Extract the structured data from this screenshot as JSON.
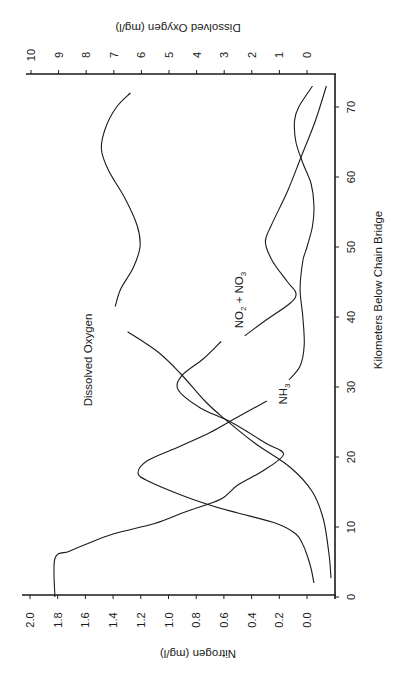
{
  "chart_data": {
    "type": "line",
    "orientation": "rotated-90-ccw",
    "title": "",
    "xlabel": "Kilometers Below Chain Bridge",
    "ylabel": "Nitrogen  (mg/l)",
    "y2label": "Dissolved Oxygen  (mg/l)",
    "xlim": [
      0,
      74
    ],
    "ylim": [
      -0.1,
      2.0
    ],
    "y2lim": [
      -0.5,
      10
    ],
    "x_ticks": [
      0,
      10,
      20,
      30,
      40,
      50,
      60,
      70
    ],
    "y_ticks": [
      "0.0",
      "0.2",
      "0.4",
      "0.6",
      "0.8",
      "1.0",
      "1.2",
      "1.4",
      "1.6",
      "1.8",
      "2.0"
    ],
    "y2_ticks": [
      "0",
      "1",
      "2",
      "3",
      "4",
      "5",
      "6",
      "7",
      "8",
      "9",
      "10"
    ],
    "grid": false,
    "legend": "inline curve labels",
    "series": [
      {
        "name": "Dissolved Oxygen",
        "label": "Dissolved Oxygen",
        "axis": "y2",
        "segments": [
          [
            [
              72.0,
              6.4
            ],
            [
              70.0,
              6.9
            ],
            [
              67.0,
              7.3
            ],
            [
              64.0,
              7.45
            ],
            [
              61.0,
              7.2
            ],
            [
              57.0,
              6.6
            ],
            [
              53.0,
              6.15
            ],
            [
              50.0,
              6.05
            ],
            [
              47.0,
              6.3
            ],
            [
              44.0,
              6.75
            ],
            [
              41.5,
              6.95
            ]
          ],
          [
            [
              37.9,
              6.5
            ],
            [
              35.0,
              5.4
            ],
            [
              32.0,
              4.6
            ],
            [
              28.0,
              3.7
            ],
            [
              25.5,
              3.0
            ],
            [
              22.0,
              1.9
            ],
            [
              18.5,
              0.6
            ],
            [
              15.0,
              -0.2
            ],
            [
              11.0,
              -0.6
            ],
            [
              6.0,
              -0.8
            ],
            [
              2.7,
              -0.87
            ]
          ]
        ]
      },
      {
        "name": "NO2 + NO3",
        "label": "NO2 + NO3",
        "axis": "y",
        "segments": [
          [
            [
              0.0,
              1.82
            ],
            [
              5.5,
              1.82
            ],
            [
              6.5,
              1.72
            ],
            [
              7.5,
              1.6
            ],
            [
              9.0,
              1.4
            ],
            [
              10.5,
              1.1
            ],
            [
              12.0,
              0.9
            ],
            [
              12.5,
              0.83
            ],
            [
              14.0,
              0.62
            ],
            [
              16.0,
              0.5
            ],
            [
              18.0,
              0.32
            ],
            [
              20.4,
              0.17
            ],
            [
              22.0,
              0.3
            ],
            [
              25.0,
              0.55
            ],
            [
              27.0,
              0.77
            ],
            [
              29.6,
              0.93
            ],
            [
              31.7,
              0.9
            ],
            [
              34.0,
              0.75
            ],
            [
              36.5,
              0.62
            ]
          ],
          [
            [
              37.3,
              0.45
            ],
            [
              39.5,
              0.3
            ],
            [
              42.0,
              0.12
            ],
            [
              43.4,
              0.08
            ],
            [
              45.0,
              0.14
            ],
            [
              48.0,
              0.25
            ],
            [
              50.7,
              0.3
            ],
            [
              53.0,
              0.26
            ],
            [
              58.0,
              0.14
            ],
            [
              63.0,
              0.04
            ],
            [
              68.0,
              -0.06
            ],
            [
              73.0,
              -0.14
            ]
          ]
        ]
      },
      {
        "name": "NH3",
        "label": "NH3",
        "axis": "y",
        "segments": [
          [
            [
              2.0,
              -0.05
            ],
            [
              4.0,
              -0.03
            ],
            [
              6.0,
              0.0
            ],
            [
              7.5,
              0.03
            ],
            [
              9.0,
              0.08
            ],
            [
              10.5,
              0.22
            ],
            [
              12.0,
              0.5
            ],
            [
              13.0,
              0.68
            ],
            [
              14.5,
              0.9
            ],
            [
              16.5,
              1.14
            ],
            [
              17.7,
              1.22
            ],
            [
              19.5,
              1.15
            ],
            [
              21.5,
              0.92
            ],
            [
              23.5,
              0.7
            ],
            [
              25.5,
              0.52
            ],
            [
              28.0,
              0.29
            ]
          ]
        ],
        "segments_after_label": [
          [
            [
              31.0,
              0.13
            ],
            [
              33.0,
              0.05
            ],
            [
              36.0,
              0.02
            ],
            [
              40.0,
              0.03
            ],
            [
              44.0,
              0.05
            ],
            [
              48.0,
              0.03
            ],
            [
              50.0,
              0.0
            ],
            [
              53.0,
              -0.04
            ],
            [
              56.0,
              -0.05
            ],
            [
              59.0,
              -0.03
            ],
            [
              62.0,
              0.03
            ],
            [
              65.0,
              0.08
            ],
            [
              68.0,
              0.09
            ],
            [
              70.0,
              0.06
            ],
            [
              73.0,
              -0.04
            ]
          ]
        ]
      }
    ],
    "annotations": [
      {
        "text": "Dissolved Oxygen",
        "km": 37.5,
        "value_axis": "y2",
        "value": 7.9
      },
      {
        "text": "NO2 + NO3",
        "km": 37.5,
        "value_axis": "y",
        "value": 0.5
      },
      {
        "text": "NH3",
        "km": 28.5,
        "value_axis": "y",
        "value": 0.15
      }
    ]
  },
  "labels": {
    "x_axis_title": "Kilometers Below Chain Bridge",
    "left_axis_title": "Nitrogen  (mg/l)",
    "right_axis_title": "Dissolved Oxygen  (mg/l)",
    "curve_do": "Dissolved Oxygen",
    "curve_no": "NO",
    "curve_no_sub1": "2",
    "curve_plus": " + NO",
    "curve_no_sub2": "3",
    "curve_nh": "NH",
    "curve_nh_sub": "3"
  },
  "colors": {
    "ink": "#1a1a1a",
    "background": "#ffffff"
  }
}
